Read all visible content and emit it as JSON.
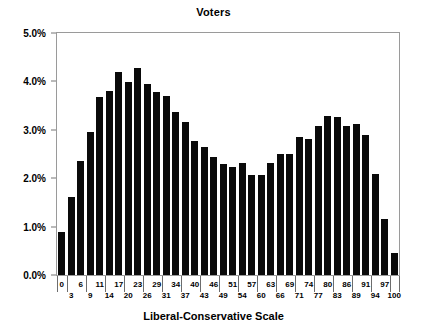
{
  "chart_data": {
    "type": "bar",
    "title": "Voters",
    "xlabel": "Liberal-Conservative Scale",
    "ylabel": "",
    "ylim": [
      0,
      5
    ],
    "ytick_labels": [
      "0.0%",
      "1.0%",
      "2.0%",
      "3.0%",
      "4.0%",
      "5.0%"
    ],
    "ytick_values": [
      0,
      1,
      2,
      3,
      4,
      5
    ],
    "grid": false,
    "legend": null,
    "categories": [
      "0",
      "3",
      "6",
      "9",
      "11",
      "14",
      "17",
      "20",
      "23",
      "26",
      "29",
      "31",
      "34",
      "37",
      "40",
      "43",
      "46",
      "49",
      "51",
      "54",
      "57",
      "60",
      "63",
      "66",
      "69",
      "71",
      "74",
      "77",
      "80",
      "83",
      "86",
      "89",
      "91",
      "94",
      "97",
      "100"
    ],
    "values": [
      0.88,
      1.62,
      2.35,
      2.96,
      3.67,
      3.81,
      4.2,
      3.98,
      4.27,
      3.94,
      3.79,
      3.7,
      3.36,
      3.16,
      2.76,
      2.64,
      2.44,
      2.29,
      2.23,
      2.32,
      2.07,
      2.07,
      2.31,
      2.51,
      2.51,
      2.85,
      2.82,
      3.07,
      3.28,
      3.26,
      3.08,
      3.12,
      2.89,
      2.08,
      1.15,
      0.45
    ],
    "value_unit": "%",
    "bar_color": "#0a0a0a",
    "axis_color": "#9a9a9a"
  },
  "chart": {
    "title": "Voters",
    "x_axis_title": "Liberal-Conservative Scale"
  }
}
